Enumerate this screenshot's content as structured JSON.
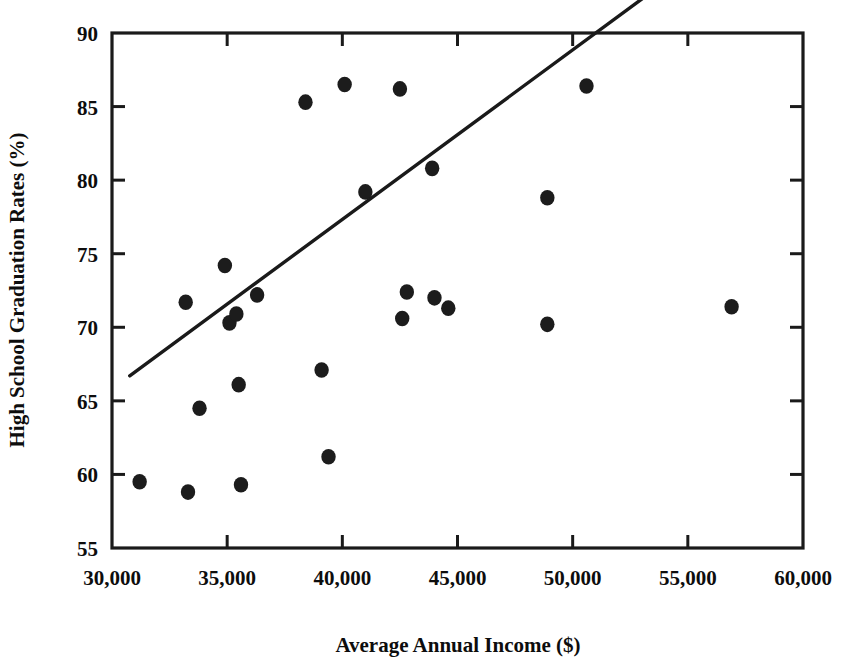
{
  "chart_data": {
    "type": "scatter",
    "title": "",
    "xlabel": "Average Annual Income ($)",
    "ylabel": "High School Graduation Rates (%)",
    "xlim": [
      30000,
      60000
    ],
    "ylim": [
      55,
      90
    ],
    "xticks": [
      30000,
      35000,
      40000,
      45000,
      50000,
      55000,
      60000
    ],
    "xticklabels": [
      "30,000",
      "35,000",
      "40,000",
      "45,000",
      "50,000",
      "55,000",
      "60,000"
    ],
    "yticks": [
      55,
      60,
      65,
      70,
      75,
      80,
      85,
      90
    ],
    "yticklabels": [
      "55",
      "60",
      "65",
      "70",
      "75",
      "80",
      "85",
      "90"
    ],
    "grid": false,
    "legend": null,
    "marker": "filled-circle",
    "marker_color": "#1c1c1c",
    "line_color": "#1a1a1a",
    "points": [
      {
        "x": 31200,
        "y": 59.5
      },
      {
        "x": 33200,
        "y": 71.7
      },
      {
        "x": 33300,
        "y": 58.8
      },
      {
        "x": 33800,
        "y": 64.5
      },
      {
        "x": 34900,
        "y": 74.2
      },
      {
        "x": 35100,
        "y": 70.3
      },
      {
        "x": 35400,
        "y": 70.9
      },
      {
        "x": 35500,
        "y": 66.1
      },
      {
        "x": 35600,
        "y": 59.3
      },
      {
        "x": 36300,
        "y": 72.2
      },
      {
        "x": 38400,
        "y": 85.3
      },
      {
        "x": 39100,
        "y": 67.1
      },
      {
        "x": 39400,
        "y": 61.2
      },
      {
        "x": 40100,
        "y": 86.5
      },
      {
        "x": 41000,
        "y": 79.2
      },
      {
        "x": 42500,
        "y": 86.2
      },
      {
        "x": 42600,
        "y": 70.6
      },
      {
        "x": 42800,
        "y": 72.4
      },
      {
        "x": 43900,
        "y": 80.8
      },
      {
        "x": 44000,
        "y": 72.0
      },
      {
        "x": 44600,
        "y": 71.3
      },
      {
        "x": 48900,
        "y": 70.2
      },
      {
        "x": 48900,
        "y": 78.8
      },
      {
        "x": 50600,
        "y": 86.4
      },
      {
        "x": 56900,
        "y": 71.4
      }
    ],
    "trendline": {
      "x_start": 30770,
      "y_start": 66.7,
      "x_end": 44400,
      "y_end": 82.4,
      "visible_x_end": 56400
    }
  }
}
